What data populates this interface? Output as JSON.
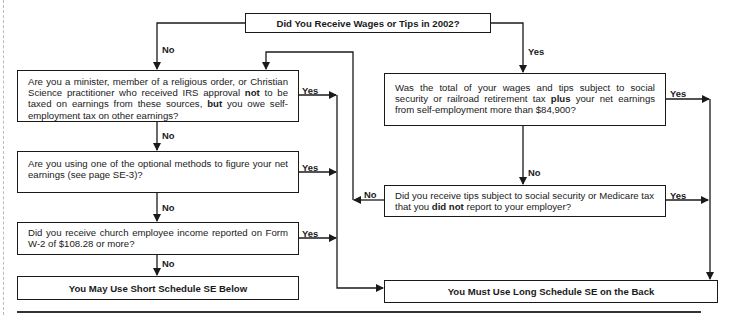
{
  "flowchart": {
    "start": {
      "text": "Did You Receive Wages or Tips in 2002?"
    },
    "left": {
      "q1": {
        "pre": "Are you a minister, member of a religious order, or Christian Science practitioner who received IRS approval ",
        "bold1": "not",
        "mid": " to be taxed on earnings from these sources, ",
        "bold2": "but",
        "post": " you owe self-employment tax on other earnings?"
      },
      "q2": {
        "text": "Are you using one of the optional methods to figure your net earnings (see page SE-3)?"
      },
      "q3": {
        "text": "Did you receive church employee income reported on Form W-2 of $108.28 or more?"
      },
      "result": {
        "text": "You May Use Short Schedule SE Below"
      }
    },
    "right": {
      "q1": {
        "pre": "Was the total of your wages and tips subject to social security or railroad retirement tax ",
        "bold": "plus",
        "post": " your net earnings from self-employment more than $84,900?"
      },
      "q2": {
        "pre": "Did you receive tips subject to social security or Medicare tax that you ",
        "bold": "did not",
        "post": " report to your employer?"
      },
      "result": {
        "text": "You Must Use Long Schedule SE on the Back"
      }
    },
    "labels": {
      "yes": "Yes",
      "no": "No"
    }
  }
}
